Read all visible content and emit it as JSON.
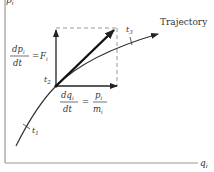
{
  "diagram": {
    "type": "phase-space-trajectory",
    "axes": {
      "y_label": "p",
      "y_subscript": "i",
      "x_label": "q",
      "x_subscript": "i"
    },
    "trajectory_label": "Trajectory",
    "time_points": [
      {
        "label": "t",
        "subscript": "1"
      },
      {
        "label": "t",
        "subscript": "2"
      },
      {
        "label": "t",
        "subscript": "3"
      }
    ],
    "equations": {
      "momentum": {
        "numerator": "dp",
        "numerator_sub": "i",
        "denominator": "dt",
        "rhs": "F",
        "rhs_sub": "i",
        "equals": "="
      },
      "position": {
        "numerator": "dq",
        "numerator_sub": "i",
        "denominator": "dt",
        "rhs_num": "p",
        "rhs_num_sub": "i",
        "rhs_den": "m",
        "rhs_den_sub": "i",
        "equals": "="
      }
    },
    "colors": {
      "line": "#333333",
      "axis": "#888888",
      "dashed": "#999999"
    }
  }
}
